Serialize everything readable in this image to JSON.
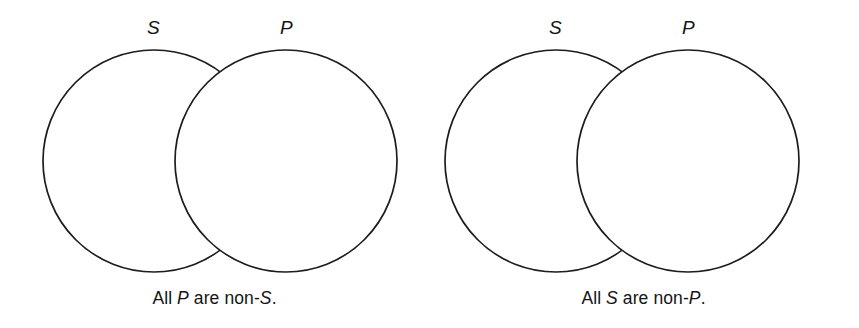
{
  "figure": {
    "type": "two-circle-venn-pair",
    "background_color": "#ffffff",
    "stroke_color": "#1c1c1c",
    "shade_color": "#c9c9c9",
    "diagrams": [
      {
        "id": "left",
        "left_circle_label": "S",
        "right_circle_label": "P",
        "shaded_region": "intersection",
        "caption_prefix": "All ",
        "caption_subject": "P",
        "caption_middle": " are non-",
        "caption_predicate": "S",
        "caption_suffix": ".",
        "caption_plain": "All P are non-S."
      },
      {
        "id": "right",
        "left_circle_label": "S",
        "right_circle_label": "P",
        "shaded_region": "intersection",
        "caption_prefix": "All ",
        "caption_subject": "S",
        "caption_middle": " are non-",
        "caption_predicate": "P",
        "caption_suffix": ".",
        "caption_plain": "All S are non-P."
      }
    ]
  }
}
